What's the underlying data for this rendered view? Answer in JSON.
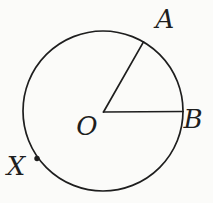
{
  "figure": {
    "type": "circle-with-radii-diagram",
    "labels": {
      "center": "O",
      "point_a": "A",
      "point_b": "B",
      "point_x": "X"
    },
    "colors": {
      "ink": "#1e1e1e",
      "background": "#fbfbf9"
    }
  }
}
